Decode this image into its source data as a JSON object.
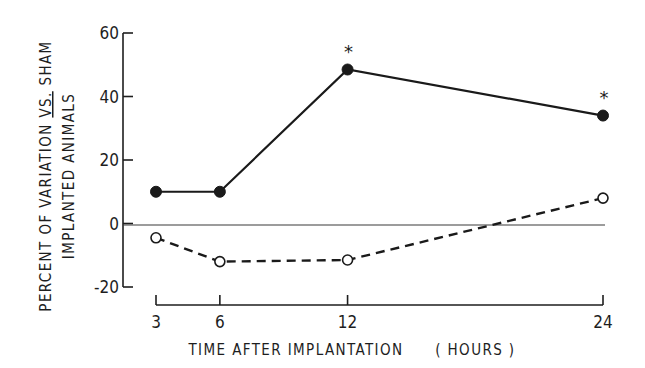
{
  "chart_data": {
    "type": "line",
    "title": "",
    "xlabel": "TIME AFTER IMPLANTATION",
    "xlabel_units": "( HOURS )",
    "ylabel_line1": "PERCENT OF VARIATION VS. SHAM",
    "ylabel_line2": "IMPLANTED ANIMALS",
    "ylabel_underlined": "VS.",
    "x": [
      3,
      6,
      12,
      24
    ],
    "x_tick_labels": [
      "3",
      "6",
      "12",
      "24"
    ],
    "y_ticks": [
      60,
      40,
      20,
      0,
      -20
    ],
    "y_tick_labels": [
      "60",
      "40",
      "20",
      "0",
      "-20"
    ],
    "ylim": [
      -20,
      60
    ],
    "xlim": [
      3,
      24
    ],
    "grid": false,
    "reference_line": {
      "y": 0,
      "style": "solid thin"
    },
    "series": [
      {
        "name": "Filled circles (solid line)",
        "marker": "filled-circle",
        "line_style": "solid",
        "values": [
          10,
          10,
          48.5,
          34
        ],
        "significance_markers": [
          "",
          "",
          "*",
          "*"
        ]
      },
      {
        "name": "Open circles (dashed line)",
        "marker": "open-circle",
        "line_style": "dashed",
        "values": [
          -4.5,
          -12,
          -11.5,
          8
        ]
      }
    ],
    "annotations": [
      {
        "text": "*",
        "x": 12,
        "series": 0
      },
      {
        "text": "*",
        "x": 24,
        "series": 0
      }
    ],
    "legend": null
  }
}
